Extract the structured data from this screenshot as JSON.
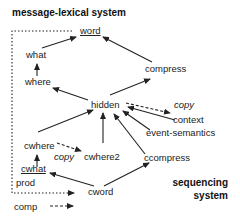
{
  "diagram": {
    "titles": {
      "top": "message-lexical system",
      "bottom_line1": "sequencing",
      "bottom_line2": "system"
    },
    "nodes": {
      "word": "word",
      "what": "what",
      "where": "where",
      "compress": "compress",
      "hidden": "hidden",
      "copy_top": "copy",
      "context": "context",
      "event_semantics": "event-semantics",
      "cwhere": "cwhere",
      "copy_mid": "copy",
      "cwhere2": "cwhere2",
      "ccompress": "ccompress",
      "cwhat": "cwhat",
      "prod": "prod",
      "cword": "cword",
      "comp": "comp"
    },
    "edges": [
      {
        "from": "what",
        "to": "word",
        "style": "solid"
      },
      {
        "from": "where",
        "to": "what",
        "style": "solid"
      },
      {
        "from": "hidden",
        "to": "where",
        "style": "solid"
      },
      {
        "from": "compress",
        "to": "word",
        "style": "solid"
      },
      {
        "from": "hidden",
        "to": "compress",
        "style": "solid"
      },
      {
        "from": "hidden",
        "to": "context",
        "style": "dashed",
        "label": "copy"
      },
      {
        "from": "context",
        "to": "hidden",
        "style": "solid"
      },
      {
        "from": "event-semantics",
        "to": "hidden",
        "style": "solid"
      },
      {
        "from": "cwhere",
        "to": "hidden",
        "style": "solid"
      },
      {
        "from": "cwhere2",
        "to": "hidden",
        "style": "solid"
      },
      {
        "from": "ccompress",
        "to": "hidden",
        "style": "solid"
      },
      {
        "from": "cwhere",
        "to": "cwhere2",
        "style": "dashed",
        "label": "copy"
      },
      {
        "from": "cwhat",
        "to": "cwhere",
        "style": "solid"
      },
      {
        "from": "cword",
        "to": "cwhat",
        "style": "solid"
      },
      {
        "from": "cword",
        "to": "ccompress",
        "style": "solid"
      },
      {
        "from": "prod",
        "to": "cword",
        "style": "dashed",
        "note": "from word via dotted loop"
      },
      {
        "from": "comp",
        "to": "cword",
        "style": "dashed"
      }
    ]
  }
}
